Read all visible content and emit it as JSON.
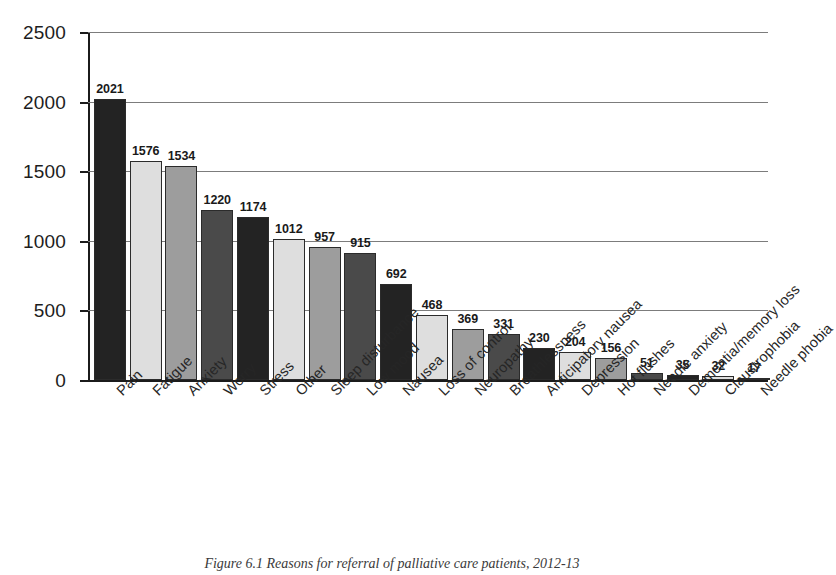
{
  "chart_data": {
    "type": "bar",
    "title": "",
    "xlabel": "",
    "ylabel": "",
    "ylim": [
      0,
      2500
    ],
    "ytick_labels": [
      "0",
      "500",
      "1000",
      "1500",
      "2000",
      "2500"
    ],
    "yticks": [
      0,
      500,
      1000,
      1500,
      2000,
      2500
    ],
    "grid": true,
    "legend": "none",
    "categories": [
      "Pain",
      "Fatigue",
      "Anxiety",
      "Worry",
      "Stress",
      "Other",
      "Sleep disturbance",
      "Low mood",
      "Nausea",
      "Loss of control",
      "Neuropathy",
      "Breathlessness",
      "Anticipatory nausea",
      "Depression",
      "Hot flushes",
      "Needle anxiety",
      "Dementia/memory loss",
      "Claustrophobia",
      "Needle phobia"
    ],
    "values": [
      2021,
      1576,
      1534,
      1220,
      1174,
      1012,
      957,
      915,
      692,
      468,
      369,
      331,
      230,
      204,
      156,
      51,
      35,
      32,
      17
    ],
    "value_labels": [
      "2021",
      "1576",
      "1534",
      "1220",
      "1174",
      "1012",
      "957",
      "915",
      "692",
      "468",
      "369",
      "331",
      "230",
      "204",
      "156",
      "51",
      "35",
      "32",
      "17"
    ],
    "bar_colors": [
      "#232323",
      "#dedede",
      "#9d9d9d",
      "#4a4a4a",
      "#232323",
      "#dedede",
      "#9d9d9d",
      "#4a4a4a",
      "#232323",
      "#dedede",
      "#9d9d9d",
      "#4a4a4a",
      "#232323",
      "#dedede",
      "#9d9d9d",
      "#4a4a4a",
      "#232323",
      "#dedede",
      "#9d9d9d"
    ]
  },
  "caption": {
    "text": "Figure 6.1 Reasons for referral of palliative care patients, 2012-13"
  },
  "colors": {
    "axis": "#1b1b1b",
    "gridline": "#7c7c7c",
    "text": "#1d1d1d",
    "dark": "#232323",
    "light": "#dedede",
    "medium": "#9d9d9d",
    "darkgray": "#4a4a4a"
  }
}
